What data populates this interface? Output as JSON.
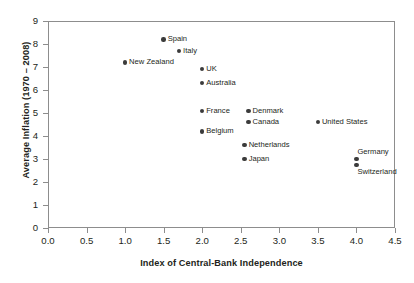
{
  "chart_data": {
    "type": "scatter",
    "title": "",
    "xlabel": "Index of Central-Bank Independence",
    "ylabel": "Average Inflation (1970 – 2008)",
    "xlim": [
      0.0,
      4.5
    ],
    "ylim": [
      0,
      9
    ],
    "xticks": [
      "0.0",
      "0.5",
      "1.0",
      "1.5",
      "2.0",
      "2.5",
      "3.0",
      "3.5",
      "4.0",
      "4.5"
    ],
    "yticks": [
      "0",
      "1",
      "2",
      "3",
      "4",
      "5",
      "6",
      "7",
      "8",
      "9"
    ],
    "grid": false,
    "legend": "none",
    "marker_color": "#3b3b3b",
    "axis_color": "#8d8d8d",
    "points": [
      {
        "name": "Spain",
        "x": 1.5,
        "y": 8.2,
        "label_side": "right"
      },
      {
        "name": "Italy",
        "x": 1.7,
        "y": 7.7,
        "label_side": "right"
      },
      {
        "name": "New Zealand",
        "x": 1.0,
        "y": 7.2,
        "label_side": "right"
      },
      {
        "name": "UK",
        "x": 2.0,
        "y": 6.9,
        "label_side": "right"
      },
      {
        "name": "Australia",
        "x": 2.0,
        "y": 6.3,
        "label_side": "right"
      },
      {
        "name": "France",
        "x": 2.0,
        "y": 5.1,
        "label_side": "right"
      },
      {
        "name": "Denmark",
        "x": 2.6,
        "y": 5.1,
        "label_side": "right"
      },
      {
        "name": "Canada",
        "x": 2.6,
        "y": 4.6,
        "label_side": "right"
      },
      {
        "name": "Belgium",
        "x": 2.0,
        "y": 4.2,
        "label_side": "right"
      },
      {
        "name": "United States",
        "x": 3.5,
        "y": 4.6,
        "label_side": "right"
      },
      {
        "name": "Netherlands",
        "x": 2.55,
        "y": 3.6,
        "label_side": "right"
      },
      {
        "name": "Japan",
        "x": 2.55,
        "y": 3.0,
        "label_side": "right"
      },
      {
        "name": "Germany",
        "x": 4.0,
        "y": 3.0,
        "label_side": "above"
      },
      {
        "name": "Switzerland",
        "x": 4.0,
        "y": 2.75,
        "label_side": "below"
      }
    ]
  }
}
